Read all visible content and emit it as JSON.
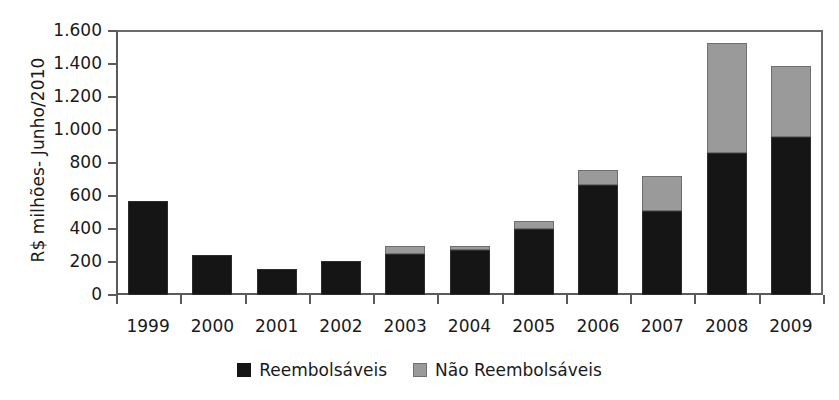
{
  "chart_data": {
    "type": "bar",
    "stacked": true,
    "title": "",
    "xlabel": "",
    "ylabel": "R$ milhões- Junho/2010",
    "ylim": [
      0,
      1600
    ],
    "ytick_step": 200,
    "ytick_labels": [
      "1.600",
      "1.400",
      "1.200",
      "1.000",
      "800",
      "600",
      "400",
      "200",
      "0"
    ],
    "ytick_values": [
      1600,
      1400,
      1200,
      1000,
      800,
      600,
      400,
      200,
      0
    ],
    "grid": false,
    "legend_position": "bottom-center",
    "categories": [
      "1999",
      "2000",
      "2001",
      "2002",
      "2003",
      "2004",
      "2005",
      "2006",
      "2007",
      "2008",
      "2009"
    ],
    "series": [
      {
        "name": "Reembolsáveis",
        "color": "#151515",
        "values": [
          570,
          240,
          155,
          205,
          250,
          270,
          400,
          665,
          510,
          860,
          960
        ]
      },
      {
        "name": "Não Reembolsáveis",
        "color": "#9a9a9a",
        "values": [
          0,
          0,
          0,
          0,
          50,
          25,
          50,
          90,
          210,
          665,
          425
        ]
      }
    ],
    "totals": [
      570,
      240,
      155,
      205,
      300,
      295,
      450,
      755,
      720,
      1525,
      1385
    ]
  },
  "legend": {
    "items": [
      {
        "label": "Reembolsáveis",
        "swatch": "black-square-icon"
      },
      {
        "label": "Não Reembolsáveis",
        "swatch": "gray-square-icon"
      }
    ]
  }
}
